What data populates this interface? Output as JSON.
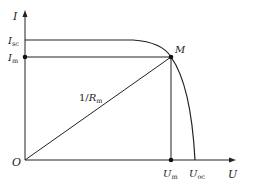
{
  "diagram": {
    "axes": {
      "y_label": "I",
      "x_label": "U",
      "origin_label": "O"
    },
    "labels": {
      "isc": {
        "main": "I",
        "sub": "sc"
      },
      "im": {
        "main": "I",
        "sub": "m"
      },
      "um": {
        "main": "U",
        "sub": "m"
      },
      "uoc": {
        "main": "U",
        "sub": "oc"
      },
      "point_m": "M",
      "slope": {
        "prefix": "1/",
        "main": "R",
        "sub": "m"
      }
    },
    "colors": {
      "line": "#222222",
      "background": "#ffffff"
    }
  }
}
